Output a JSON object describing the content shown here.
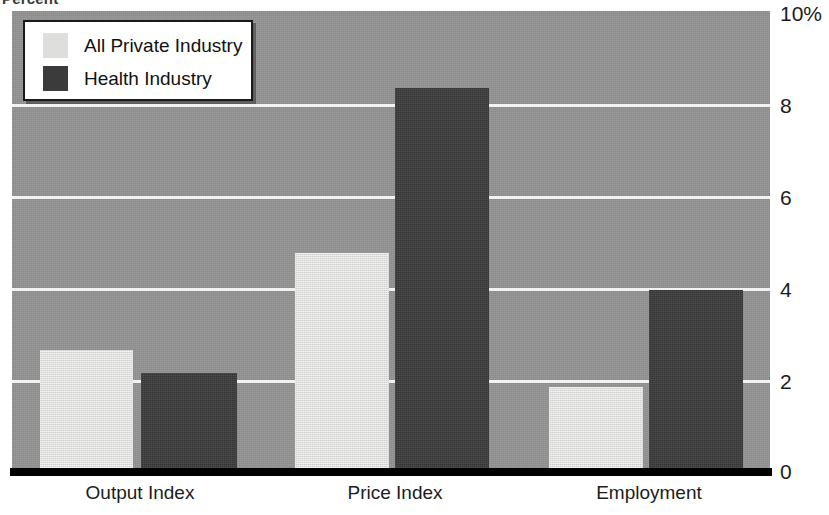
{
  "chart_data": {
    "type": "bar",
    "title": "",
    "axis_corner_label": "Percent",
    "ylabel": "",
    "xlabel": "",
    "categories": [
      "Output Index",
      "Price Index",
      "Employment"
    ],
    "series": [
      {
        "name": "All Private Industry",
        "color": "#dededc",
        "values": [
          2.7,
          4.8,
          1.9
        ]
      },
      {
        "name": "Health Industry",
        "color": "#3b3b3b",
        "values": [
          2.2,
          8.4,
          4.0
        ]
      }
    ],
    "ylim": [
      0,
      10
    ],
    "ytick_values": [
      0,
      2,
      4,
      6,
      8,
      10
    ],
    "ytick_labels": [
      "0",
      "2",
      "4",
      "6",
      "8",
      "10%"
    ],
    "ytick_position": "right",
    "grid": true,
    "grid_color": "#f2f2f2",
    "plot_background": "#949494",
    "legend_position": "upper left",
    "legend": {
      "entries": [
        {
          "label": "All Private Industry",
          "swatch": "light"
        },
        {
          "label": "Health Industry",
          "swatch": "dark"
        }
      ]
    }
  }
}
